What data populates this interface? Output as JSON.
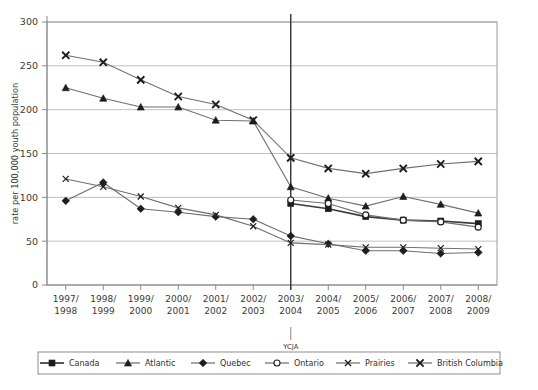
{
  "chart_data": {
    "type": "line",
    "title": "",
    "xlabel": "",
    "ylabel": "rate per 100,000 youth population",
    "ylim": [
      0,
      300
    ],
    "yticks": [
      0,
      50,
      100,
      150,
      200,
      250,
      300
    ],
    "grid": true,
    "legend_position": "bottom",
    "categories": [
      "1997/\n1998",
      "1998/\n1999",
      "1999/\n2000",
      "2000/\n2001",
      "2001/\n2002",
      "2002/\n2003",
      "2003/\n2004",
      "2004/\n2005",
      "2005/\n2006",
      "2006/\n2007",
      "2007/\n2008",
      "2008/\n2009"
    ],
    "annotations": [
      {
        "label": "YCJA",
        "at_category": "2003/\n2004",
        "type": "vertical-line"
      }
    ],
    "series": [
      {
        "name": "Canada",
        "marker": "filled-square",
        "emphasis": "bold",
        "values": [
          null,
          null,
          null,
          null,
          null,
          null,
          93,
          87,
          78,
          74,
          73,
          70
        ]
      },
      {
        "name": "Atlantic",
        "marker": "filled-triangle",
        "emphasis": "normal",
        "values": [
          225,
          213,
          203,
          203,
          188,
          187,
          112,
          99,
          90,
          101,
          92,
          82
        ]
      },
      {
        "name": "Quebec",
        "marker": "filled-diamond",
        "emphasis": "normal",
        "values": [
          96,
          117,
          87,
          83,
          78,
          75,
          56,
          47,
          39,
          39,
          36,
          37
        ]
      },
      {
        "name": "Ontario",
        "marker": "open-circle",
        "emphasis": "normal",
        "values": [
          null,
          null,
          null,
          null,
          null,
          null,
          97,
          93,
          80,
          74,
          72,
          66
        ]
      },
      {
        "name": "Prairies",
        "marker": "x-thin",
        "emphasis": "normal",
        "values": [
          121,
          112,
          101,
          88,
          80,
          67,
          48,
          46,
          43,
          43,
          42,
          41
        ]
      },
      {
        "name": "British Columbia",
        "marker": "x-bold",
        "emphasis": "normal",
        "values": [
          262,
          254,
          234,
          215,
          206,
          188,
          145,
          133,
          127,
          133,
          138,
          141
        ]
      }
    ]
  },
  "legend": {
    "items": [
      {
        "label": "Canada"
      },
      {
        "label": "Atlantic"
      },
      {
        "label": "Quebec"
      },
      {
        "label": "Ontario"
      },
      {
        "label": "Prairies"
      },
      {
        "label": "British Columbia"
      }
    ]
  }
}
